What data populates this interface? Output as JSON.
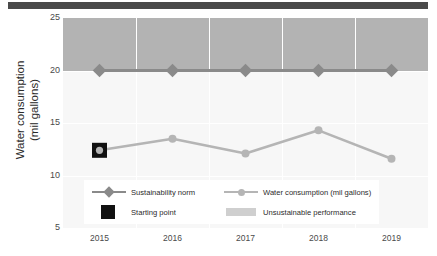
{
  "chart_data": {
    "type": "line",
    "title": "",
    "xlabel": "",
    "ylabel": "Water consumption (mil gallons)",
    "ylabel_line1": "Water consumption",
    "ylabel_line2": "(mil gallons)",
    "categories": [
      "2015",
      "2016",
      "2017",
      "2018",
      "2019"
    ],
    "x": [
      2015,
      2016,
      2017,
      2018,
      2019
    ],
    "ylim": [
      5,
      25
    ],
    "yticks": [
      25,
      20,
      15,
      10,
      5
    ],
    "ytick_labels": [
      "25",
      "20",
      "15",
      "10",
      "5"
    ],
    "grid": true,
    "legend_position": "inside-bottom-left",
    "series": [
      {
        "name": "Sustainability norm",
        "values": [
          20,
          20,
          20,
          20,
          20
        ],
        "color": "#8a8a8a",
        "marker": "diamond"
      },
      {
        "name": "Water consumption (mil gallons)",
        "values": [
          12.4,
          13.5,
          12.1,
          14.3,
          11.6
        ],
        "color": "#b5b5b5",
        "marker": "circle"
      }
    ],
    "annotations": [
      {
        "name": "Starting point",
        "x": "2015",
        "y": 12.4,
        "marker": "square",
        "color": "#111111"
      }
    ],
    "bands": [
      {
        "name": "Unsustainable performance",
        "from": 20,
        "to": 25,
        "color": "#b3b3b3"
      }
    ]
  },
  "legend": {
    "items": [
      {
        "label": "Sustainability norm",
        "key": "line-diamond",
        "color": "#8a8a8a"
      },
      {
        "label": "Water consumption (mil gallons)",
        "key": "line-circle",
        "color": "#b5b5b5"
      },
      {
        "label": "Starting point",
        "key": "square",
        "color": "#111111"
      },
      {
        "label": "Unsustainable performance",
        "key": "band",
        "color": "#cfcfcf"
      }
    ]
  },
  "decor": {
    "top_rule_color": "#4a4a4a",
    "plot_background": "#f7f7f7",
    "gridline_color": "#ffffff"
  }
}
